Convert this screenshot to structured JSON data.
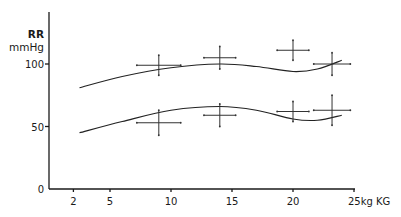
{
  "chart_data": {
    "type": "scatter",
    "title": "",
    "ylabel": "RR\nmmHg",
    "ylabel_lines": [
      "RR",
      "mmHg"
    ],
    "xlabel": "kg KG",
    "xlim": [
      0,
      25
    ],
    "ylim": [
      0,
      100
    ],
    "x_ticks": [
      {
        "value": 2,
        "label": "2"
      },
      {
        "value": 5,
        "label": "5"
      },
      {
        "value": 10,
        "label": "10"
      },
      {
        "value": 15,
        "label": "15"
      },
      {
        "value": 20,
        "label": "20"
      },
      {
        "value": 25,
        "label": "25kg KG"
      }
    ],
    "y_ticks": [
      {
        "value": 0,
        "label": "0"
      },
      {
        "value": 50,
        "label": "50"
      },
      {
        "value": 100,
        "label": "100"
      }
    ],
    "grid": false,
    "legend": "none",
    "series": [
      {
        "name": "systolic",
        "points": [
          {
            "x": 9,
            "y": 99,
            "x_err": 1.8,
            "y_err": 8
          },
          {
            "x": 14,
            "y": 105,
            "x_err": 1.3,
            "y_err": 9
          },
          {
            "x": 20,
            "y": 111,
            "x_err": 1.3,
            "y_err": 8
          },
          {
            "x": 23.2,
            "y": 100,
            "x_err": 1.5,
            "y_err": 9
          }
        ],
        "fit_curve": [
          [
            2.5,
            81
          ],
          [
            6,
            90
          ],
          [
            10,
            97
          ],
          [
            14,
            100
          ],
          [
            17,
            98
          ],
          [
            20,
            94
          ],
          [
            22,
            96
          ],
          [
            24,
            103
          ]
        ]
      },
      {
        "name": "diastolic",
        "points": [
          {
            "x": 9,
            "y": 53,
            "x_err": 1.8,
            "y_err": 10
          },
          {
            "x": 14,
            "y": 59,
            "x_err": 1.3,
            "y_err": 9
          },
          {
            "x": 20,
            "y": 62,
            "x_err": 1.3,
            "y_err": 8
          },
          {
            "x": 23.2,
            "y": 63,
            "x_err": 1.5,
            "y_err": 12
          }
        ],
        "fit_curve": [
          [
            2.5,
            45
          ],
          [
            6,
            54
          ],
          [
            10,
            63
          ],
          [
            14,
            66
          ],
          [
            17,
            63
          ],
          [
            20,
            56
          ],
          [
            22,
            55
          ],
          [
            24,
            59
          ]
        ]
      }
    ]
  }
}
